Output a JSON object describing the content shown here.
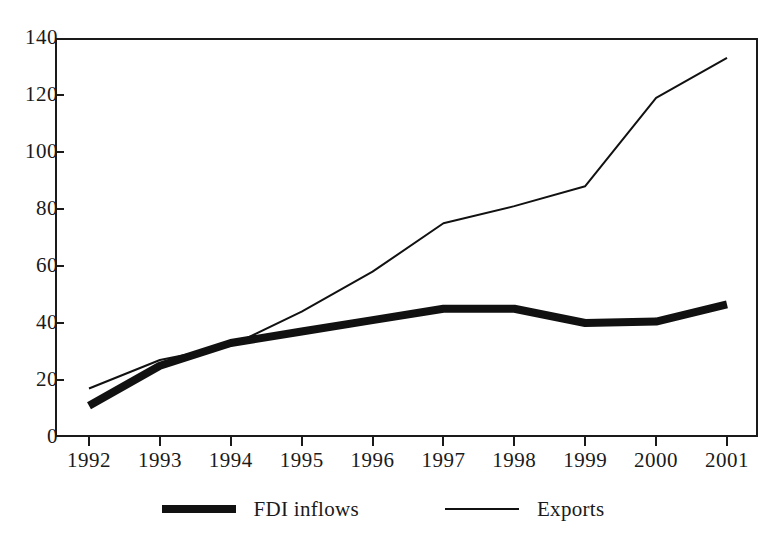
{
  "chart_data": {
    "type": "line",
    "title": "",
    "xlabel": "",
    "ylabel": "",
    "categories": [
      "1992",
      "1993",
      "1994",
      "1995",
      "1996",
      "1997",
      "1998",
      "1999",
      "2000",
      "2001"
    ],
    "ylim": [
      0,
      140
    ],
    "xlim": [
      1992,
      2001
    ],
    "y_ticks": [
      0,
      20,
      40,
      60,
      80,
      100,
      120,
      140
    ],
    "grid": false,
    "legend_position": "bottom",
    "series": [
      {
        "name": "FDI inflows",
        "style": "thick",
        "color": "#111111",
        "values": [
          11,
          25,
          33,
          37,
          41,
          45,
          45,
          40,
          40.5,
          46.5
        ]
      },
      {
        "name": "Exports",
        "style": "thin",
        "color": "#111111",
        "values": [
          17,
          27,
          32,
          44,
          58,
          75,
          81,
          88,
          119,
          133
        ]
      }
    ]
  },
  "legend": {
    "items": [
      {
        "label": "FDI inflows",
        "swatch": "thick-line-swatch"
      },
      {
        "label": "Exports",
        "swatch": "thin-line-swatch"
      }
    ]
  }
}
